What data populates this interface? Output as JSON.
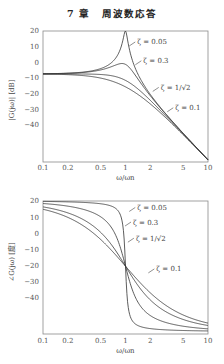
{
  "header": {
    "chapter": "7 章",
    "title": "周波数応答"
  },
  "chart_data": [
    {
      "type": "line",
      "title": "",
      "xlabel": "ω/ωn",
      "ylabel": "|G(jω)| [dB]",
      "xscale": "log",
      "xlim": [
        0.1,
        10
      ],
      "ylim": [
        -63,
        20
      ],
      "xticks": [
        "0.1",
        "0.2",
        "0.5",
        "1",
        "2",
        "5",
        "10"
      ],
      "xtick_values": [
        0.1,
        0.2,
        0.5,
        1,
        2,
        5,
        10
      ],
      "yticks": [
        "20",
        "10",
        "0",
        "−10",
        "−20",
        "−30",
        "−40"
      ],
      "ytick_values": [
        20,
        10,
        0,
        -10,
        -20,
        -30,
        -40
      ],
      "grid": false,
      "legend": "inline annotations",
      "annotations": [
        {
          "text": "ζ = 0.05",
          "x": 1.35,
          "y": 13
        },
        {
          "text": "ζ = 0.3",
          "x": 1.6,
          "y": 1
        },
        {
          "text": "ζ = 1/√2",
          "x": 2.6,
          "y": -16
        },
        {
          "text": "ζ = 0.1",
          "x": 3.9,
          "y": -29
        }
      ],
      "series": [
        {
          "name": "ζ = 0.05",
          "zeta": 0.05
        },
        {
          "name": "ζ = 0.3",
          "zeta": 0.3
        },
        {
          "name": "ζ = 1/√2",
          "zeta": 0.7071
        },
        {
          "name": "ζ = 1",
          "zeta": 1.0
        }
      ],
      "x": [
        0.1,
        0.2,
        0.5,
        0.8,
        1,
        1.25,
        2,
        5,
        10
      ],
      "series_values": {
        "ζ = 0.05": [
          -7.3,
          -7.0,
          -3.5,
          5.0,
          20.0,
          4.0,
          -13.0,
          -45.0,
          -62.0
        ],
        "ζ = 0.3": [
          -7.3,
          -7.0,
          -4.5,
          -1.0,
          -0.1,
          -4.5,
          -18.0,
          -45.5,
          -62.0
        ],
        "ζ = 1/√2": [
          -7.4,
          -7.8,
          -10.0,
          -12.5,
          -11.5,
          -16.0,
          -24.0,
          -47.0,
          -62.5
        ],
        "ζ = 1": [
          -7.5,
          -8.6,
          -13.0,
          -17.0,
          -15.6,
          -19.0,
          -26.5,
          -48.5,
          -63.0
        ]
      }
    },
    {
      "type": "line",
      "title": "",
      "xlabel": "ω/ωn",
      "ylabel": "∠G(jω) [度]",
      "xscale": "log",
      "xlim": [
        0.1,
        10
      ],
      "ylim": [
        -62,
        20
      ],
      "xticks": [
        "0.1",
        "0.2",
        "0.5",
        "1",
        "2",
        "5",
        "10"
      ],
      "xtick_values": [
        0.1,
        0.2,
        0.5,
        1,
        2,
        5,
        10
      ],
      "yticks": [
        "20",
        "10",
        "0",
        "−10",
        "−20",
        "−30",
        "−40"
      ],
      "ytick_values": [
        20,
        10,
        0,
        -10,
        -20,
        -30,
        -40
      ],
      "grid": false,
      "legend": "inline annotations",
      "annotations": [
        {
          "text": "ζ = 0.05",
          "x": 1.35,
          "y": 16
        },
        {
          "text": "ζ = 0.3",
          "x": 1.2,
          "y": 7
        },
        {
          "text": "ζ = 1/√2",
          "x": 1.3,
          "y": -3
        },
        {
          "text": "ζ = 0.1",
          "x": 2.3,
          "y": -22
        }
      ],
      "series": [
        {
          "name": "ζ = 0.05",
          "zeta": 0.05
        },
        {
          "name": "ζ = 0.3",
          "zeta": 0.3
        },
        {
          "name": "ζ = 1/√2",
          "zeta": 0.7071
        },
        {
          "name": "ζ = 1",
          "zeta": 1.0
        }
      ],
      "x": [
        0.1,
        0.2,
        0.5,
        0.8,
        1,
        1.25,
        2,
        5,
        10
      ],
      "series_values": {
        "ζ = 0.05": [
          19.8,
          19.5,
          18.9,
          17.1,
          -20.3,
          -57.2,
          -58.8,
          -59.5,
          -59.8
        ],
        "ζ = 0.3": [
          18.7,
          17.4,
          11.8,
          0.8,
          -20.3,
          -39.7,
          -51.9,
          -56.9,
          -58.2
        ],
        "ζ = 1/√2": [
          16.0,
          11.6,
          -0.8,
          -12.4,
          -20.3,
          -28.3,
          -41.8,
          -52.8,
          -55.8
        ],
        "ζ = 1": [
          15.0,
          9.8,
          -3.9,
          -14.6,
          -20.3,
          -26.1,
          -37.3,
          -50.2,
          -54.6
        ]
      }
    }
  ]
}
